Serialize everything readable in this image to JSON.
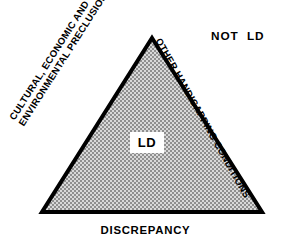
{
  "figure": {
    "background_color": "#ffffff",
    "outline_color": "#000000",
    "fill_pattern": "checkerboard-gray",
    "fill_colors": [
      "#9a9a9a",
      "#d8d8d8"
    ]
  },
  "triangle": {
    "apex": {
      "x": 152,
      "y": 38
    },
    "bottom_left": {
      "x": 42,
      "y": 212
    },
    "bottom_right": {
      "x": 262,
      "y": 212
    },
    "stroke_width": 4
  },
  "labels": {
    "left_edge": {
      "line1": "CULTURAL, ECONOMIC AND",
      "line2": "ENVIRONMENTAL PRECLUSIONS",
      "rotation_deg": -57.5
    },
    "right_edge": {
      "text": "OTHER HANDICAPPING CONDITIONS",
      "rotation_deg": 60.5
    },
    "bottom_edge": {
      "text": "DISCREPANCY"
    },
    "outside": {
      "text": "NOT  LD"
    },
    "center": {
      "text": "LD"
    }
  }
}
